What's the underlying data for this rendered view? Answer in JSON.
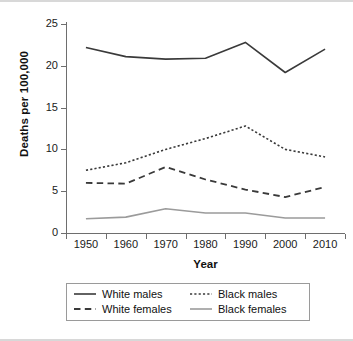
{
  "chart_data": {
    "type": "line",
    "title": "",
    "xlabel": "Year",
    "ylabel": "Deaths per 100,000",
    "x": [
      1950,
      1960,
      1970,
      1980,
      1990,
      2000,
      2010
    ],
    "xticklabels": [
      "1950",
      "1960",
      "1970",
      "1980",
      "1990",
      "2000",
      "2010"
    ],
    "yticklabels": [
      "0",
      "5",
      "10",
      "15",
      "20",
      "25"
    ],
    "yticks": [
      0,
      5,
      10,
      15,
      20,
      25
    ],
    "xlim": [
      1945,
      2015
    ],
    "ylim": [
      0,
      25
    ],
    "grid": false,
    "legend_position": "below-axes",
    "series": [
      {
        "name": "White males",
        "style": "solid",
        "color": "#3a3a3a",
        "width": 1.6,
        "values": [
          22.2,
          21.1,
          20.8,
          20.9,
          22.8,
          19.2,
          22.0
        ]
      },
      {
        "name": "Black males",
        "style": "dotted",
        "color": "#3a3a3a",
        "width": 1.6,
        "values": [
          7.5,
          8.4,
          10.0,
          11.3,
          12.8,
          10.0,
          9.1
        ]
      },
      {
        "name": "White females",
        "style": "dashed",
        "color": "#3a3a3a",
        "width": 1.8,
        "values": [
          6.0,
          5.9,
          7.9,
          6.4,
          5.2,
          4.3,
          5.5
        ]
      },
      {
        "name": "Black females",
        "style": "solid",
        "color": "#9b9b9b",
        "width": 1.6,
        "values": [
          1.7,
          1.9,
          2.9,
          2.4,
          2.4,
          1.8,
          1.8
        ]
      }
    ]
  },
  "legend": {
    "entries": [
      {
        "label": "White males"
      },
      {
        "label": "Black males"
      },
      {
        "label": "White females"
      },
      {
        "label": "Black females"
      }
    ]
  },
  "colors": {
    "axis": "#6e6e6e",
    "text": "#1a1a1a",
    "dark_series": "#3a3a3a",
    "gray_series": "#9b9b9b",
    "legend_border": "#9a9a9a",
    "frame_rule": "#d8d8d8",
    "background": "#ffffff"
  }
}
